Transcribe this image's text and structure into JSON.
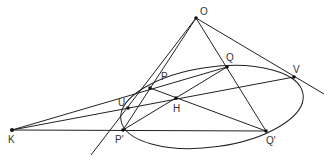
{
  "diagram": {
    "type": "projective-geometry-conic",
    "stroke_color": "#222222",
    "points": {
      "O": {
        "label": "O",
        "x": 196,
        "y": 18
      },
      "Q": {
        "label": "Q",
        "x": 227,
        "y": 67
      },
      "V": {
        "label": "V",
        "x": 294,
        "y": 77
      },
      "P": {
        "label": "P",
        "x": 150,
        "y": 88
      },
      "U": {
        "label": "U",
        "x": 128,
        "y": 108
      },
      "H": {
        "label": "H",
        "x": 176,
        "y": 98
      },
      "K": {
        "label": "K",
        "x": 12,
        "y": 130
      },
      "Pp": {
        "label": "P'",
        "x": 123,
        "y": 130
      },
      "Qp": {
        "label": "Q'",
        "x": 266,
        "y": 131
      }
    },
    "ellipse": {
      "cx": 212,
      "cy": 107,
      "rx": 92,
      "ry": 40,
      "rotate_deg": -8
    }
  }
}
